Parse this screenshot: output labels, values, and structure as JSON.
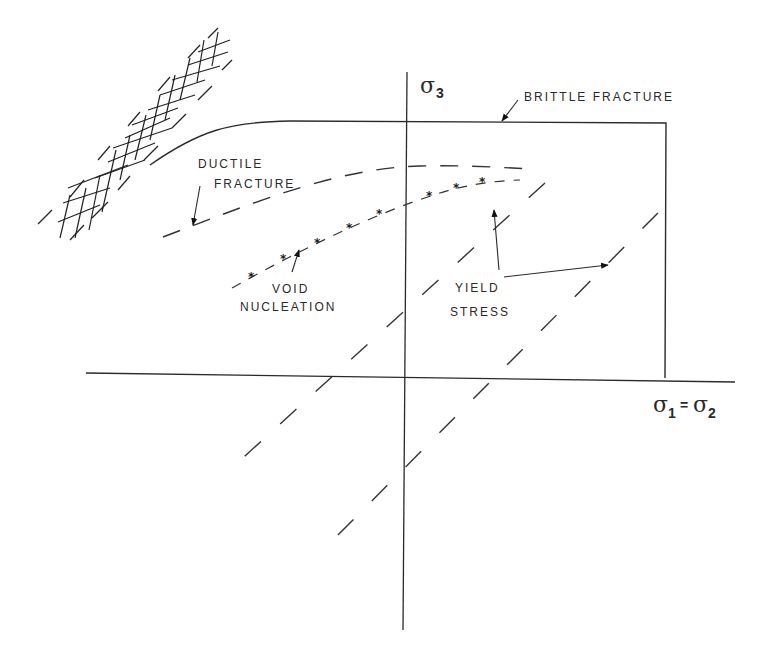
{
  "diagram": {
    "type": "stress-space failure diagram",
    "axes": {
      "vertical_label_base": "σ",
      "vertical_label_sub": "3",
      "horizontal_label_base1": "σ",
      "horizontal_label_sub1": "1",
      "horizontal_label_eq": "=",
      "horizontal_label_base2": "σ",
      "horizontal_label_sub2": "2"
    },
    "curves": [
      {
        "id": "brittle-fracture",
        "label": "BRITTLE FRACTURE",
        "style": "solid"
      },
      {
        "id": "ductile-fracture",
        "label_line1": "DUCTILE",
        "label_line2": "FRACTURE",
        "style": "dashed"
      },
      {
        "id": "void-nucleation",
        "label_line1": "VOID",
        "label_line2": "NUCLEATION",
        "style": "dash-star"
      },
      {
        "id": "yield-stress",
        "label_line1": "YIELD",
        "label_line2": "STRESS",
        "style": "long-dashed, two parallel lines"
      }
    ],
    "star_marker": "*",
    "hatched_region": "cross-hatched band at upper left"
  },
  "colors": {
    "ink": "#2a2a2a",
    "background": "#ffffff"
  }
}
